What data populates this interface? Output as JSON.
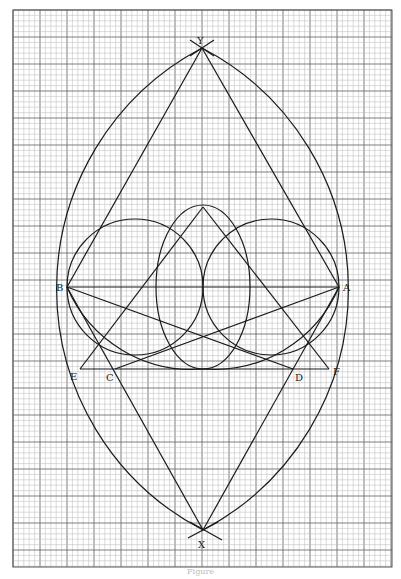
{
  "figure": {
    "caption": "Figure",
    "grid": {
      "x0": 13,
      "y0": 10,
      "x1": 392,
      "y1": 567,
      "minor": 5.4,
      "major_every": 5,
      "minor_color": "#b8b8b8",
      "major_color": "#707070"
    },
    "points": {
      "Y": {
        "x": 202,
        "y": 48,
        "label": "Y"
      },
      "X": {
        "x": 203,
        "y": 530,
        "label": "X"
      },
      "B": {
        "x": 67,
        "y": 287,
        "label": "B"
      },
      "A": {
        "x": 339,
        "y": 287,
        "label": "A"
      },
      "E": {
        "x": 80,
        "y": 369,
        "label": "E"
      },
      "F": {
        "x": 329,
        "y": 369,
        "label": "F"
      },
      "C": {
        "x": 115,
        "y": 369,
        "label": "C"
      },
      "D": {
        "x": 293,
        "y": 369,
        "label": "D"
      },
      "T": {
        "x": 203,
        "y": 207
      }
    },
    "labels": {
      "Y": "Y",
      "X": "X",
      "B": "B",
      "A": "A",
      "E": "E",
      "F": "F",
      "C": "C",
      "D": "D"
    }
  }
}
